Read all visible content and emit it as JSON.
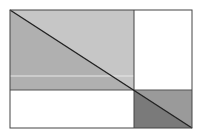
{
  "diagram": {
    "width": 198,
    "height": 139,
    "outer_box": {
      "x1": 10,
      "y1": 10,
      "x2": 192,
      "y2": 128
    },
    "vertical_divider_x": 134,
    "horizontal_divider_y": 90,
    "colors": {
      "upper_left_light": "#c8c8c8",
      "upper_left_lower_triangle": "#b0b0b0",
      "lower_right_upper_triangle": "#9c9c9c",
      "lower_right_lower_triangle": "#7a7a7a",
      "line": "#222222",
      "white": "#ffffff",
      "faint_line": "#e6e6e6"
    },
    "faint_line_y": 76
  }
}
